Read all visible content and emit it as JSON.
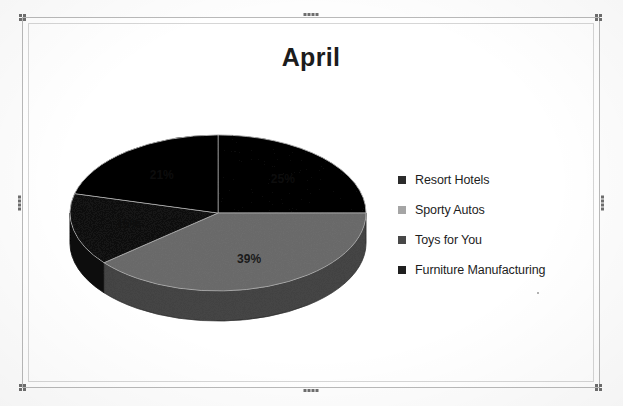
{
  "chart_data": {
    "type": "pie",
    "title": "April",
    "categories": [
      "Resort Hotels",
      "Sporty Autos",
      "Toys for You",
      "Furniture Manufacturing"
    ],
    "values": [
      25,
      39,
      15,
      21
    ],
    "value_labels": [
      "25%",
      "39%",
      "15%",
      "21%"
    ],
    "units": "percent",
    "colors": [
      "#2b2b2b",
      "#a5a5a5",
      "#484848",
      "#1f1f1f"
    ],
    "label_colors": [
      "#0d0d0d",
      "#1a1a1a",
      "#0d0d0d",
      "#0d0d0d"
    ],
    "legend_position": "right",
    "three_d": true,
    "start_angle_deg": 0,
    "direction": "clockwise",
    "xlabel": "",
    "ylabel": "",
    "grid": false,
    "data_labels_shown": true
  },
  "chart_object": {
    "selected": true,
    "handle_icon": "selection-handle-icon"
  },
  "legend": {
    "items": [
      {
        "label": "Resort Hotels",
        "color": "#2b2b2b",
        "swatch_icon": "legend-swatch-icon"
      },
      {
        "label": "Sporty Autos",
        "color": "#a5a5a5",
        "swatch_icon": "legend-swatch-icon"
      },
      {
        "label": "Toys for You",
        "color": "#484848",
        "swatch_icon": "legend-swatch-icon"
      },
      {
        "label": "Furniture Manufacturing",
        "color": "#1f1f1f",
        "swatch_icon": "legend-swatch-icon"
      }
    ]
  }
}
